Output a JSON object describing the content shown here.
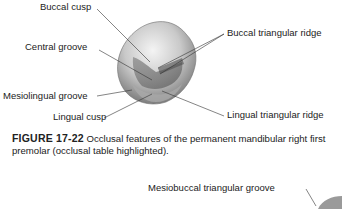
{
  "figure_1": {
    "labels": {
      "buccal_cusp": "Buccal cusp",
      "central_groove": "Central groove",
      "mesiolingual_groove": "Mesiolingual groove",
      "lingual_cusp": "Lingual cusp",
      "buccal_triangular_ridge": "Buccal triangular ridge",
      "lingual_triangular_ridge": "Lingual triangular ridge"
    },
    "caption": {
      "number": "FIGURE 17-22",
      "text": " Occlusal features of the permanent mandibular right first premolar (occlusal table highlighted)."
    }
  },
  "figure_2": {
    "labels": {
      "mesiobuccal_triangular_groove": "Mesiobuccal triangular groove"
    }
  }
}
